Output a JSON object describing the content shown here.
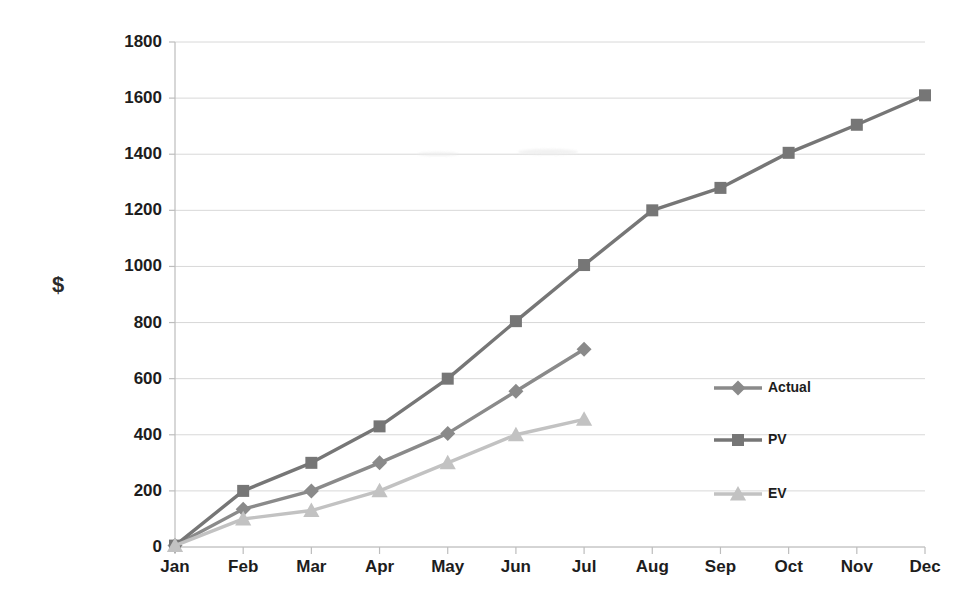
{
  "chart_data": {
    "type": "line",
    "title": "",
    "xlabel": "",
    "ylabel": "$",
    "ylim": [
      0,
      1800
    ],
    "ytick_step": 200,
    "yticks": [
      1800,
      1600,
      1400,
      1200,
      1000,
      800,
      600,
      400,
      200,
      0
    ],
    "categories": [
      "Jan",
      "Feb",
      "Mar",
      "Apr",
      "May",
      "Jun",
      "Jul",
      "Aug",
      "Sep",
      "Oct",
      "Nov",
      "Dec"
    ],
    "grid": "horizontal",
    "legend_position": "right-middle",
    "series": [
      {
        "name": "Actual",
        "marker": "diamond",
        "color": "#8a8a8a",
        "values": [
          5,
          135,
          200,
          300,
          405,
          555,
          705,
          null,
          null,
          null,
          null,
          null
        ]
      },
      {
        "name": "PV",
        "marker": "square",
        "color": "#767676",
        "values": [
          5,
          200,
          300,
          430,
          600,
          805,
          1005,
          1200,
          1280,
          1405,
          1505,
          1610
        ]
      },
      {
        "name": "EV",
        "marker": "triangle",
        "color": "#c2c2c2",
        "values": [
          5,
          100,
          130,
          200,
          300,
          400,
          455,
          null,
          null,
          null,
          null,
          null
        ]
      }
    ]
  },
  "legend": {
    "items": [
      {
        "label": "Actual"
      },
      {
        "label": "PV"
      },
      {
        "label": "EV"
      }
    ]
  },
  "colors": {
    "background": "#ffffff",
    "gridline": "#d8d8d8",
    "axis": "#bdbdbd",
    "text": "#1d1d1d",
    "actual": "#8a8a8a",
    "pv": "#767676",
    "ev": "#c2c2c2"
  }
}
